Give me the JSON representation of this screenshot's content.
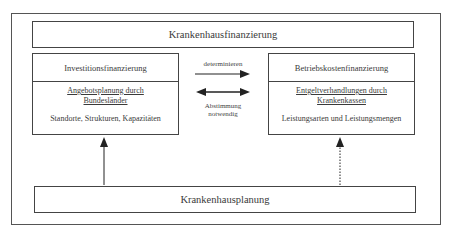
{
  "diagram": {
    "top": {
      "label": "Krankenhausfinanzierung"
    },
    "left_panel": {
      "title": "Investitionsfinanzierung",
      "subtitle_line1": "Angebotsplanung durch",
      "subtitle_line2": "Bundesländer",
      "detail": "Standorte, Strukturen, Kapazitäten"
    },
    "right_panel": {
      "title": "Betriebskostenfinanzierung",
      "subtitle_line1": "Entgeltverhandlungen durch",
      "subtitle_line2": "Krankenkassen",
      "detail": "Leistungsarten und Leistungsmengen"
    },
    "arrow_determine": {
      "label": "determinieren"
    },
    "arrow_coordinate": {
      "label_line1": "Abstimmung",
      "label_line2": "notwendig"
    },
    "bottom": {
      "label": "Krankenhausplanung"
    },
    "edges": [
      {
        "from": "left_panel",
        "to": "right_panel",
        "label": "determinieren",
        "style": "solid",
        "direction": "forward"
      },
      {
        "from": "left_panel",
        "to": "right_panel",
        "label": "Abstimmung notwendig",
        "style": "solid",
        "direction": "both"
      },
      {
        "from": "bottom",
        "to": "left_panel",
        "style": "solid",
        "direction": "forward"
      },
      {
        "from": "bottom",
        "to": "right_panel",
        "style": "dotted",
        "direction": "forward"
      }
    ]
  }
}
